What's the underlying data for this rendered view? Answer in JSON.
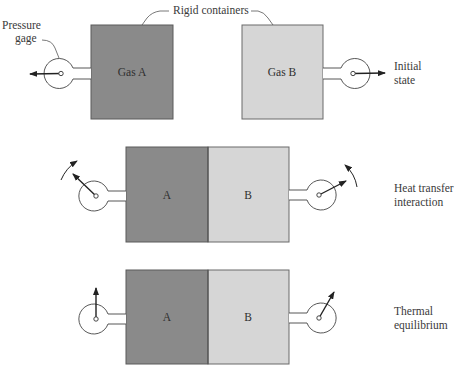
{
  "labels": {
    "pressure_gage_line1": "Pressure",
    "pressure_gage_line2": "gage",
    "rigid_containers": "Rigid containers",
    "initial_state_line1": "Initial",
    "initial_state_line2": "state",
    "heat_transfer_line1": "Heat transfer",
    "heat_transfer_line2": "interaction",
    "thermal_eq_line1": "Thermal",
    "thermal_eq_line2": "equilibrium"
  },
  "rows": [
    {
      "name": "initial-state",
      "left_box": "Gas A",
      "right_box": "Gas B"
    },
    {
      "name": "heat-transfer",
      "left_box": "A",
      "right_box": "B"
    },
    {
      "name": "thermal-equilibrium",
      "left_box": "A",
      "right_box": "B"
    }
  ],
  "colors": {
    "gas_a_fill": "#8a8a8a",
    "gas_b_fill": "#d6d6d6",
    "outline": "#555555",
    "line": "#333333"
  }
}
